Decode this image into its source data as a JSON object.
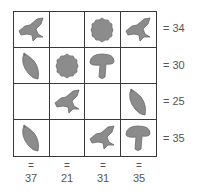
{
  "puzzle": {
    "grid": [
      [
        "bird",
        "empty",
        "flower",
        "bird"
      ],
      [
        "leaf",
        "flower",
        "mushroom",
        "empty"
      ],
      [
        "empty",
        "bird",
        "empty",
        "leaf"
      ],
      [
        "leaf",
        "empty",
        "bird",
        "mushroom"
      ]
    ],
    "row_sums": [
      "= 34",
      "= 30",
      "= 25",
      "= 35"
    ],
    "col_equals": [
      "=",
      "=",
      "=",
      "="
    ],
    "col_sums": [
      "37",
      "21",
      "31",
      "35"
    ],
    "icon_fill": "#8c8c8c",
    "icon_stroke": "#6a6a6a"
  }
}
